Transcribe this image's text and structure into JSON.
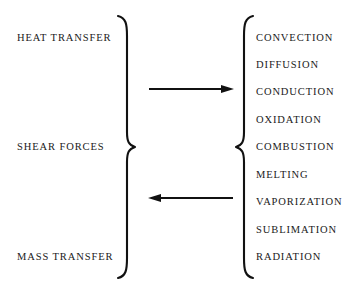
{
  "figure": {
    "ink_color": "#111111",
    "text_color": "#1a1a1a",
    "background_color": "#ffffff"
  },
  "left_group": {
    "items": [
      {
        "label": "HEAT TRANSFER",
        "top": 33
      },
      {
        "label": "SHEAR FORCES",
        "top": 142
      },
      {
        "label": "MASS TRANSFER",
        "top": 252
      }
    ]
  },
  "right_group": {
    "items": [
      {
        "label": "CONVECTION",
        "top": 33
      },
      {
        "label": "DIFFUSION",
        "top": 60
      },
      {
        "label": "CONDUCTION",
        "top": 87
      },
      {
        "label": "OXIDATION",
        "top": 115
      },
      {
        "label": "COMBUSTION",
        "top": 142
      },
      {
        "label": "MELTING",
        "top": 170
      },
      {
        "label": "VAPORIZATION",
        "top": 197
      },
      {
        "label": "SUBLIMATION",
        "top": 225
      },
      {
        "label": "RADIATION",
        "top": 252
      }
    ]
  },
  "arrows": [
    {
      "name": "forward-arrow",
      "direction": "right"
    },
    {
      "name": "reverse-arrow",
      "direction": "left"
    }
  ],
  "braces": [
    {
      "name": "left-brace",
      "orientation": "right-facing"
    },
    {
      "name": "right-brace",
      "orientation": "left-facing"
    }
  ]
}
